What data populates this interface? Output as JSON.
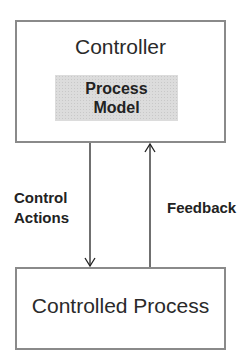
{
  "diagram": {
    "controller": {
      "title": "Controller"
    },
    "process_model": {
      "line1": "Process",
      "line2": "Model"
    },
    "controlled_process": {
      "title": "Controlled Process"
    },
    "edges": [
      {
        "from": "Controller",
        "to": "Controlled Process",
        "label_line1": "Control",
        "label_line2": "Actions",
        "direction": "down"
      },
      {
        "from": "Controlled Process",
        "to": "Controller",
        "label": "Feedback",
        "direction": "up"
      }
    ]
  }
}
